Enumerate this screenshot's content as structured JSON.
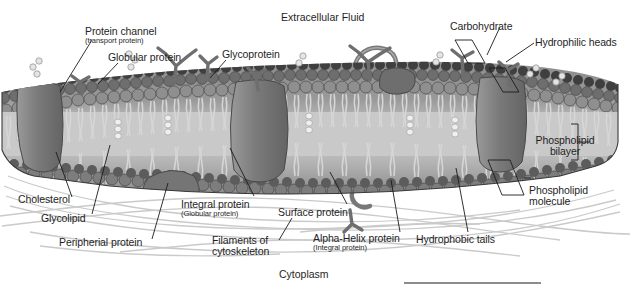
{
  "figure": {
    "type": "biology-diagram",
    "background_color": "#ffffff",
    "ink_color": "#1f1f1f"
  },
  "headings": {
    "top": {
      "text": "Extracellular Fluid",
      "x": 281,
      "y": 11
    },
    "bottom": {
      "text": "Cytoplasm",
      "x": 279,
      "y": 268
    }
  },
  "labels": [
    {
      "id": "protein-channel",
      "main": "Protein channel",
      "sub": "(transport protein)",
      "x": 85,
      "y": 26,
      "align": "left"
    },
    {
      "id": "globular-protein",
      "main": "Globular protein",
      "sub": "",
      "x": 108,
      "y": 52,
      "align": "left"
    },
    {
      "id": "glycoprotein",
      "main": "Glycoprotein",
      "sub": "",
      "x": 222,
      "y": 49,
      "align": "left"
    },
    {
      "id": "carbohydrate",
      "main": "Carbohydrate",
      "sub": "",
      "x": 450,
      "y": 21,
      "align": "left"
    },
    {
      "id": "hydrophilic-heads",
      "main": "Hydrophilic heads",
      "sub": "",
      "x": 535,
      "y": 37,
      "align": "left"
    },
    {
      "id": "phospholipid-bilayer",
      "main": "Phospholipid\nbilayer",
      "sub": "",
      "x": 565,
      "y": 135,
      "align": "center"
    },
    {
      "id": "phospholipid-molecule",
      "main": "Phospholipid\nmolecule",
      "sub": "",
      "x": 529,
      "y": 185,
      "align": "left"
    },
    {
      "id": "cholesterol",
      "main": "Cholesterol",
      "sub": "",
      "x": 18,
      "y": 194,
      "align": "left"
    },
    {
      "id": "glycolipid",
      "main": "Glycolipid",
      "sub": "",
      "x": 41,
      "y": 213,
      "align": "left"
    },
    {
      "id": "peripherial-protein",
      "main": "Peripherial protein",
      "sub": "",
      "x": 59,
      "y": 237,
      "align": "left"
    },
    {
      "id": "integral-protein",
      "main": "Integral protein",
      "sub": "(Globular protein)",
      "x": 181,
      "y": 199,
      "align": "left"
    },
    {
      "id": "filaments-cytoskeleton",
      "main": "Filaments of\ncytoskeleton",
      "sub": "",
      "x": 212,
      "y": 235,
      "align": "left"
    },
    {
      "id": "surface-protein",
      "main": "Surface protein",
      "sub": "",
      "x": 278,
      "y": 207,
      "align": "left"
    },
    {
      "id": "alpha-helix-protein",
      "main": "Alpha-Helix protein",
      "sub": "(Integral protein)",
      "x": 313,
      "y": 233,
      "align": "left"
    },
    {
      "id": "hydrophobic-tails",
      "main": "Hydrophobic tails",
      "sub": "",
      "x": 416,
      "y": 234,
      "align": "left"
    }
  ],
  "label_lines": [
    {
      "id": "line-protein-channel",
      "points": "92,40 60,92"
    },
    {
      "id": "line-globular-protein",
      "points": "118,63 98,84"
    },
    {
      "id": "line-glycoprotein",
      "points": "226,60 210,78"
    },
    {
      "id": "line-carbohydrate-a",
      "points": "500,27 487,55"
    },
    {
      "id": "line-carbohydrate-box",
      "points": "455,40 472,40 485,63 468,63 455,40"
    },
    {
      "id": "line-hydrophilic-a",
      "points": "534,43 506,62"
    },
    {
      "id": "line-hydrophilic-box",
      "points": "489,68 505,68 519,92 503,92 489,68"
    },
    {
      "id": "line-bilayer-bracket",
      "points": "571,124 578,124 578,160 571,160"
    },
    {
      "id": "line-bilayer-stem",
      "points": "578,142 590,142"
    },
    {
      "id": "line-molecule-box",
      "points": "488,160 510,160 524,195 502,195 488,160"
    },
    {
      "id": "line-molecule-lead",
      "points": "524,178 531,178"
    },
    {
      "id": "line-cholesterol",
      "points": "72,197 56,152"
    },
    {
      "id": "line-glycolipid",
      "points": "92,214 110,145"
    },
    {
      "id": "line-peripherial",
      "points": "152,239 168,183"
    },
    {
      "id": "line-integral",
      "points": "254,196 230,148"
    },
    {
      "id": "line-filaments",
      "points": "279,240 292,218"
    },
    {
      "id": "line-surface",
      "points": "347,204 330,172"
    },
    {
      "id": "line-alpha-helix",
      "points": "400,232 391,180"
    },
    {
      "id": "line-hydrophobic",
      "points": "468,232 456,168"
    },
    {
      "id": "rule-bottom",
      "points": "404,283 541,283"
    }
  ],
  "palette": {
    "head_top_dark": "#3d3d3d",
    "head_row": "#6f6f6f",
    "head_light": "#8d8d8d",
    "tail": "#d8d8d8",
    "tail_core": "#bdbdbd",
    "protein": "#828282",
    "protein_dark": "#6a6a6a",
    "carbohydrate": "#707070",
    "filament": "#c9c9c9",
    "membrane_shadow": "#555555",
    "outline": "#2a2a2a"
  },
  "structures": {
    "membrane_band": {
      "label": "phospholipid bilayer slab",
      "top_y": 60,
      "bottom_y": 190
    },
    "integral_proteins": 5,
    "glycoprotein_antennae": 5,
    "cytoskeleton_filaments": 9
  }
}
